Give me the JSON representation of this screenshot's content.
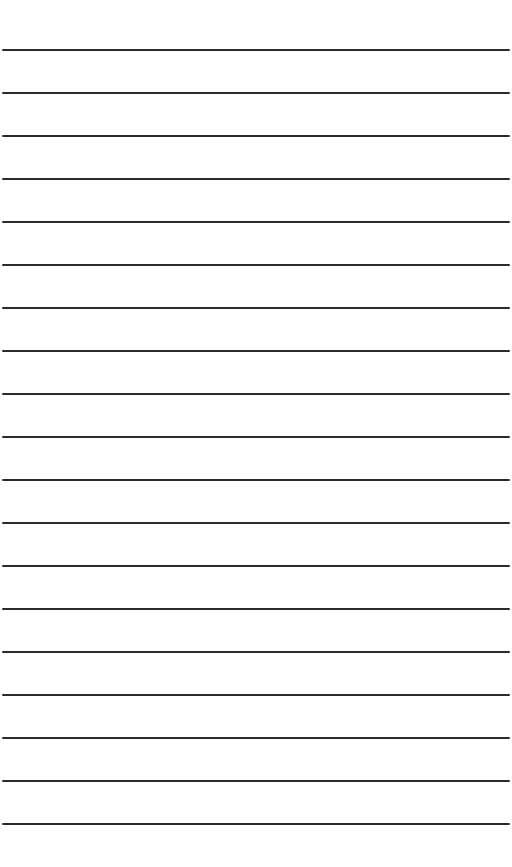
{
  "paper": {
    "background": "#ffffff",
    "line_color": "#2b2b2b",
    "line_count": 19,
    "first_line_y": 50,
    "line_spacing": 43,
    "line_thickness": 2,
    "line_left": 2,
    "line_width": 508
  }
}
